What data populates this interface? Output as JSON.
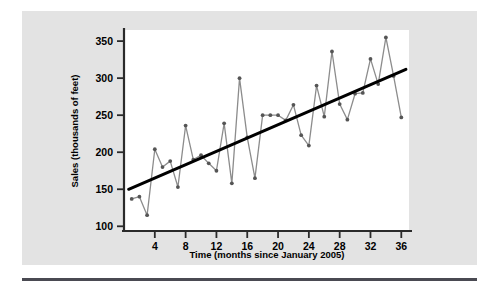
{
  "figure": {
    "background_color": "#e3e3e3",
    "plot_background_color": "#ffffff",
    "rule_color": "#4a4a52"
  },
  "chart_data": {
    "type": "line",
    "title": "",
    "subtitle": "",
    "xlabel": "Time (months since January 2005)",
    "ylabel": "Sales (thousands of feet)",
    "xlim": [
      0,
      37
    ],
    "ylim": [
      95,
      365
    ],
    "xticks": [
      4,
      8,
      12,
      16,
      20,
      24,
      28,
      32,
      36
    ],
    "yticks": [
      100,
      150,
      200,
      250,
      300,
      350
    ],
    "grid": false,
    "legend": [],
    "legend_position": "none",
    "series": [
      {
        "name": "Sales",
        "kind": "line-markers",
        "color": "#8c8c8c",
        "marker_color": "#555555",
        "x": [
          1,
          2,
          3,
          4,
          5,
          6,
          7,
          8,
          9,
          10,
          11,
          12,
          13,
          14,
          15,
          16,
          17,
          18,
          19,
          20,
          21,
          22,
          23,
          24,
          25,
          26,
          27,
          28,
          29,
          30,
          31,
          32,
          33,
          34,
          35,
          36
        ],
        "values": [
          137,
          140,
          115,
          204,
          180,
          188,
          153,
          236,
          190,
          196,
          185,
          175,
          239,
          158,
          300,
          220,
          165,
          250,
          250,
          250,
          243,
          264,
          223,
          209,
          290,
          248,
          336,
          265,
          244,
          279,
          280,
          326,
          292,
          355,
          303,
          247
        ]
      },
      {
        "name": "Trend line",
        "kind": "line",
        "color": "#000000",
        "x": [
          0.6,
          36.6
        ],
        "values": [
          150,
          312
        ]
      }
    ]
  }
}
